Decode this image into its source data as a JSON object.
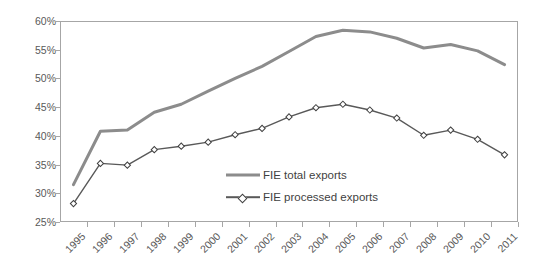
{
  "chart_data": {
    "type": "line",
    "title": "",
    "subtitle": "",
    "xlabel": "",
    "ylabel": "",
    "categories": [
      "1995",
      "1996",
      "1997",
      "1998",
      "1999",
      "2000",
      "2001",
      "2002",
      "2003",
      "2004",
      "2005",
      "2006",
      "2007",
      "2008",
      "2009",
      "2010",
      "2011"
    ],
    "ylim": [
      25,
      60
    ],
    "ytick_labels": [
      "25%",
      "30%",
      "35%",
      "40%",
      "45%",
      "50%",
      "55%",
      "60%"
    ],
    "ytick_values": [
      25,
      30,
      35,
      40,
      45,
      50,
      55,
      60
    ],
    "grid": false,
    "legend_position": "inside-lower-center",
    "series": [
      {
        "name": "FIE total exports",
        "color": "#8c8c8c",
        "marker": "none",
        "values": [
          31.5,
          40.8,
          41.0,
          44.1,
          45.5,
          47.8,
          50.0,
          52.1,
          54.7,
          57.3,
          58.4,
          58.1,
          57.0,
          55.3,
          55.9,
          54.8,
          52.4
        ]
      },
      {
        "name": "FIE processed exports",
        "color": "#595959",
        "marker": "diamond",
        "values": [
          28.2,
          35.2,
          34.9,
          37.6,
          38.2,
          38.9,
          40.2,
          41.3,
          43.3,
          44.9,
          45.5,
          44.5,
          43.1,
          40.1,
          41.0,
          39.4,
          36.7
        ]
      }
    ]
  },
  "legend": {
    "items": [
      {
        "label": "FIE total exports"
      },
      {
        "label": "FIE processed exports"
      }
    ]
  }
}
